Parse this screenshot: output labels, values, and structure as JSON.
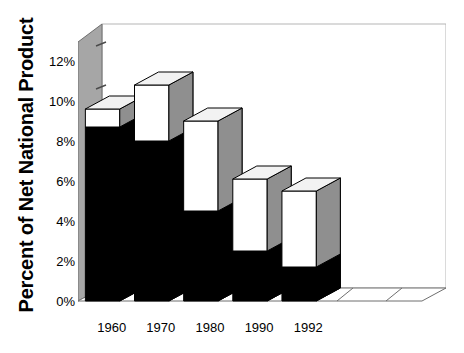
{
  "chart_data": {
    "type": "bar",
    "title": "",
    "subtitle": "",
    "xlabel": "",
    "ylabel": "Percent of Net National Product",
    "categories": [
      "1960",
      "1970",
      "1980",
      "1990",
      "1992"
    ],
    "empty_category_slots": 2,
    "series": [
      {
        "name": "lower-segment",
        "color": "#000000",
        "values": [
          8.7,
          8.0,
          4.5,
          2.5,
          1.7
        ]
      },
      {
        "name": "upper-segment",
        "color": "#ffffff",
        "values": [
          0.9,
          2.8,
          4.5,
          3.6,
          3.8
        ]
      }
    ],
    "totals": [
      9.6,
      10.8,
      9.0,
      6.1,
      5.5
    ],
    "ylim": [
      0,
      12
    ],
    "ytick_values": [
      0,
      2,
      4,
      6,
      8,
      10,
      12
    ],
    "ytick_labels": [
      "0%",
      "2%",
      "4%",
      "6%",
      "8%",
      "10%",
      "12%"
    ],
    "grid": false,
    "legend": "none",
    "style": "3d-stacked-column",
    "annotations": []
  },
  "colors": {
    "bar_lower": "#000000",
    "bar_upper": "#ffffff",
    "bar_side_shade": "#8f8f8f",
    "bar_top_shade": "#f2f2f2",
    "wall": "#a6a6a6",
    "floor": "#ffffff",
    "outline": "#000000",
    "frame_line": "#b5b5b5",
    "text": "#000000",
    "background": "#ffffff"
  }
}
